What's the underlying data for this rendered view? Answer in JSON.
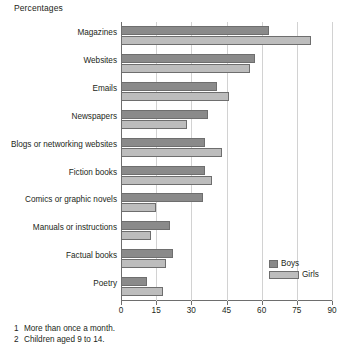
{
  "chart_data": {
    "type": "bar",
    "orientation": "horizontal",
    "title": "Percentages",
    "xlabel": "",
    "ylabel": "",
    "xlim": [
      0,
      90
    ],
    "xticks": [
      0,
      15,
      30,
      45,
      60,
      75,
      90
    ],
    "grid": true,
    "legend_position": "bottom-right",
    "categories": [
      "Magazines",
      "Websites",
      "Emails",
      "Newspapers",
      "Blogs or networking websites",
      "Fiction books",
      "Comics or graphic novels",
      "Manuals or instructions",
      "Factual books",
      "Poetry"
    ],
    "series": [
      {
        "name": "Boys",
        "color": "#8a8a8a",
        "values": [
          63,
          57,
          41,
          37,
          36,
          36,
          35,
          21,
          22,
          11
        ]
      },
      {
        "name": "Girls",
        "color": "#bdbdbd",
        "values": [
          81,
          55,
          46,
          28,
          43,
          39,
          15,
          13,
          19,
          18
        ]
      }
    ]
  },
  "footnotes": [
    {
      "num": "1",
      "text": "More than once a month."
    },
    {
      "num": "2",
      "text": "Children aged 9 to 14."
    }
  ]
}
